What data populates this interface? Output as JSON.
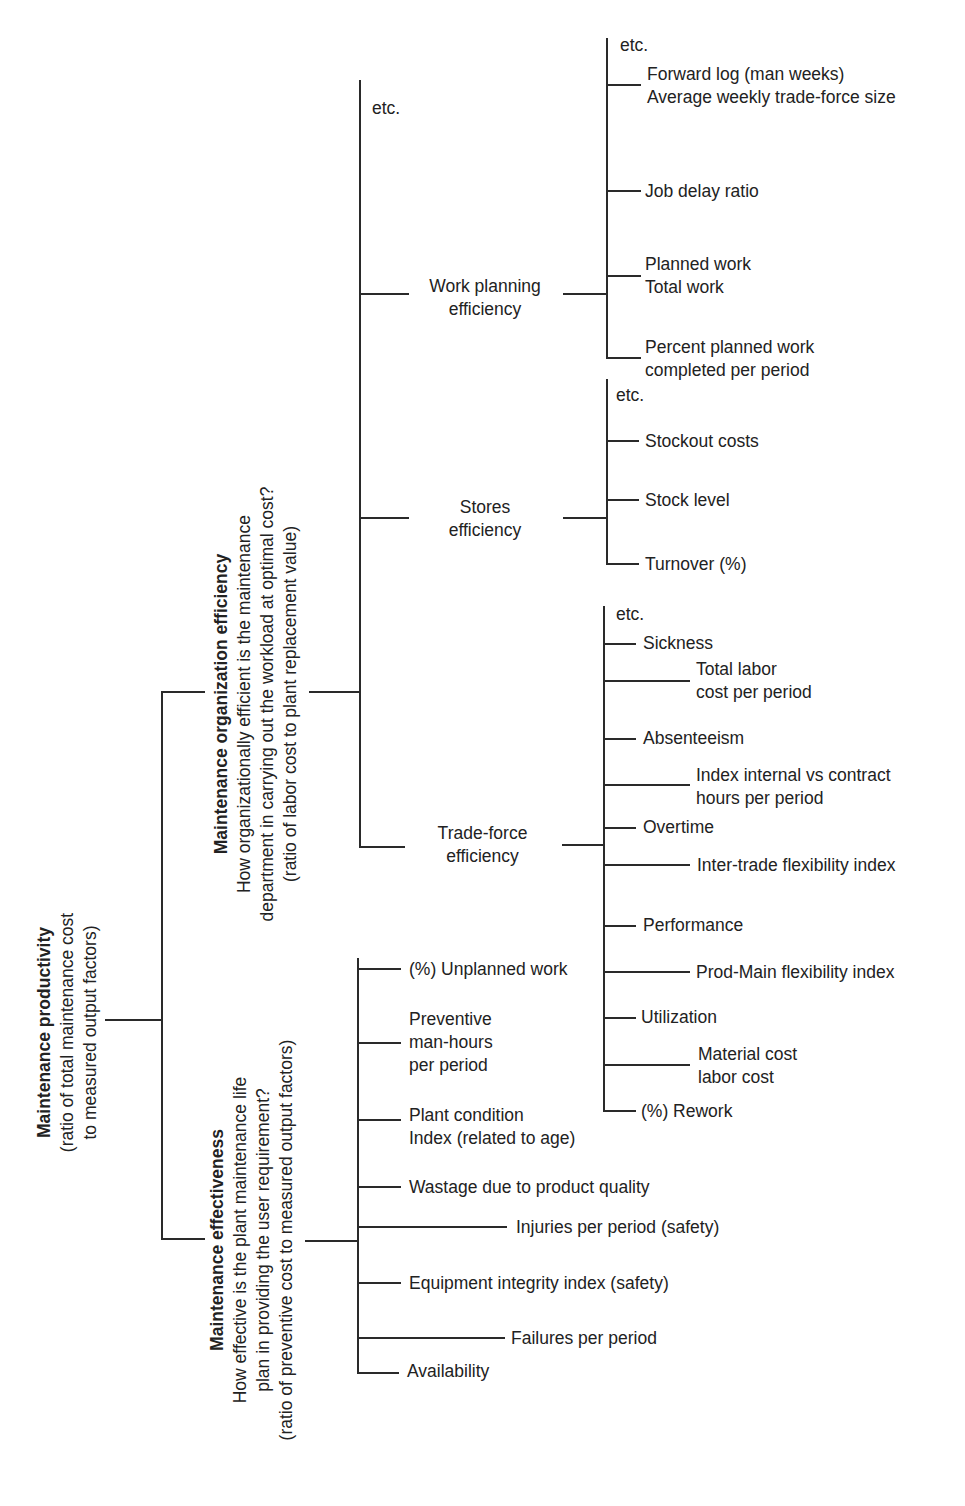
{
  "root": {
    "title": "Maintenance productivity",
    "lines": [
      "(ratio of total maintenance cost",
      "to measured output factors)"
    ]
  },
  "org_efficiency": {
    "title": "Maintenance organization efficiency",
    "lines": [
      "How organizationally efficient is the maintenance",
      "department in carrying out the workload at optimal cost?",
      "(ratio of labor cost to plant replacement value)"
    ],
    "etc": "etc.",
    "work_planning": {
      "label": [
        "Work planning",
        "efficiency"
      ],
      "items": [
        {
          "lines": [
            "etc."
          ]
        },
        {
          "lines": [
            "Forward log (man weeks)",
            "Average weekly trade-force size"
          ]
        },
        {
          "lines": [
            "Job delay ratio"
          ]
        },
        {
          "lines": [
            "Planned work",
            "Total work"
          ]
        },
        {
          "lines": [
            "Percent planned work",
            "completed per period"
          ]
        }
      ]
    },
    "stores": {
      "label": [
        "Stores",
        "efficiency"
      ],
      "items": [
        {
          "lines": [
            "etc."
          ]
        },
        {
          "lines": [
            "Stockout costs"
          ]
        },
        {
          "lines": [
            "Stock level"
          ]
        },
        {
          "lines": [
            "Turnover  (%)"
          ]
        }
      ]
    },
    "trade_force": {
      "label": [
        "Trade-force",
        "efficiency"
      ],
      "items": [
        {
          "lines": [
            "etc."
          ]
        },
        {
          "lines": [
            "Sickness"
          ]
        },
        {
          "lines": [
            "Total labor",
            "cost per period"
          ]
        },
        {
          "lines": [
            "Absenteeism"
          ]
        },
        {
          "lines": [
            "Index internal vs contract",
            "hours per period"
          ]
        },
        {
          "lines": [
            "Overtime"
          ]
        },
        {
          "lines": [
            "Inter-trade flexibility index"
          ]
        },
        {
          "lines": [
            "Performance"
          ]
        },
        {
          "lines": [
            "Prod-Main flexibility index"
          ]
        },
        {
          "lines": [
            "Utilization"
          ]
        },
        {
          "lines": [
            "Material cost",
            "labor cost"
          ]
        },
        {
          "lines": [
            "(%) Rework"
          ]
        }
      ]
    }
  },
  "effectiveness": {
    "title": "Maintenance effectiveness",
    "lines": [
      "How effective is the plant maintenance life",
      "plan in providing the user requirement?",
      "(ratio of preventive cost to measured output factors)"
    ],
    "items": [
      {
        "lines": [
          "(%) Unplanned work"
        ]
      },
      {
        "lines": [
          "Preventive",
          "man-hours",
          "per period"
        ]
      },
      {
        "lines": [
          "Plant condition",
          "Index (related to age)"
        ]
      },
      {
        "lines": [
          "Wastage due to product quality"
        ]
      },
      {
        "lines": [
          "Injuries per period (safety)"
        ]
      },
      {
        "lines": [
          "Equipment integrity index (safety)"
        ]
      },
      {
        "lines": [
          "Failures per period"
        ]
      },
      {
        "lines": [
          "Availability"
        ]
      }
    ]
  },
  "colors": {
    "line": "#2a2a2a",
    "text": "#222222",
    "background": "#ffffff"
  }
}
